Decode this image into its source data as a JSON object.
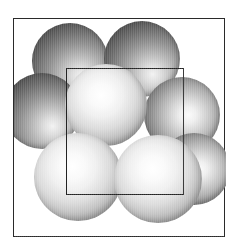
{
  "figure": {
    "kind": "crystal-structure-diagram",
    "title": "",
    "caption": "",
    "background_color": "#ffffff",
    "frame": {
      "border_color": "#2a2a2a",
      "border_width_px": 1.6,
      "x": 13,
      "y": 18,
      "width": 212,
      "height": 219
    },
    "unit_cell": {
      "label": "",
      "shape": "square",
      "outline_color": "#232323",
      "outline_width_px": 1.5,
      "x": 52,
      "y": 49,
      "width": 118,
      "height": 127
    },
    "lighting": {
      "highlight_direction": "upper-left-of-center",
      "shadow_direction": "lower-right"
    },
    "spheres": [
      {
        "id": "back-top-left",
        "layer": "back",
        "cx": 56,
        "cy": 42,
        "r": 38,
        "shade": "#333333"
      },
      {
        "id": "back-top-right",
        "layer": "back",
        "cx": 128,
        "cy": 40,
        "r": 38,
        "shade": "#333333"
      },
      {
        "id": "back-left",
        "layer": "back",
        "cx": 28,
        "cy": 92,
        "r": 38,
        "shade": "#333333"
      },
      {
        "id": "mid-right-upper",
        "layer": "mid",
        "cx": 168,
        "cy": 96,
        "r": 38,
        "shade": "#454545"
      },
      {
        "id": "front-center",
        "layer": "front",
        "cx": 92,
        "cy": 86,
        "r": 41,
        "shade": "#6b6b6b"
      },
      {
        "id": "front-bottom-left",
        "layer": "front",
        "cx": 64,
        "cy": 158,
        "r": 44,
        "shade": "#6b6b6b"
      },
      {
        "id": "front-bottom-right",
        "layer": "front",
        "cx": 144,
        "cy": 160,
        "r": 44,
        "shade": "#6b6b6b"
      },
      {
        "id": "back-bottom-right",
        "layer": "mid",
        "cx": 180,
        "cy": 150,
        "r": 36,
        "shade": "#454545"
      }
    ],
    "sphere_count": 8
  }
}
